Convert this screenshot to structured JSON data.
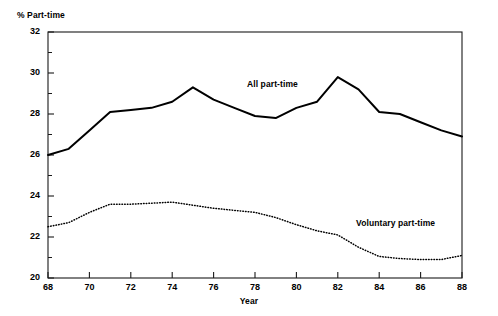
{
  "chart_data": {
    "type": "line",
    "title": "",
    "xlabel": "Year",
    "ylabel": "% Part-time",
    "xlim": [
      68,
      88
    ],
    "ylim": [
      20,
      32
    ],
    "grid": false,
    "legend_position": "inline-annotation",
    "x": [
      68,
      69,
      70,
      71,
      72,
      73,
      74,
      75,
      76,
      77,
      78,
      79,
      80,
      81,
      82,
      83,
      84,
      85,
      86,
      87,
      88
    ],
    "xticks": [
      "68",
      "70",
      "72",
      "74",
      "76",
      "78",
      "80",
      "82",
      "84",
      "86",
      "88"
    ],
    "yticks": [
      "20",
      "22",
      "24",
      "26",
      "28",
      "30",
      "32"
    ],
    "yticks_minor": [
      21,
      23,
      25,
      27,
      29,
      31
    ],
    "series": [
      {
        "name": "All part-time",
        "style": "solid",
        "color": "#000000",
        "values": [
          26.0,
          26.3,
          27.2,
          28.1,
          28.2,
          28.3,
          28.6,
          29.3,
          28.7,
          28.3,
          27.9,
          27.8,
          28.3,
          28.6,
          29.8,
          29.2,
          28.1,
          28.0,
          27.6,
          27.2,
          26.9
        ]
      },
      {
        "name": "Voluntary part-time",
        "style": "dotted",
        "color": "#000000",
        "values": [
          22.5,
          22.7,
          23.2,
          23.6,
          23.6,
          23.65,
          23.7,
          23.55,
          23.4,
          23.3,
          23.2,
          22.95,
          22.6,
          22.3,
          22.1,
          21.5,
          21.05,
          20.95,
          20.9,
          20.9,
          21.1
        ]
      }
    ]
  },
  "axes": {
    "ylabel": "% Part-time",
    "xlabel": "Year"
  },
  "annotations": {
    "all_part_time": "All part-time",
    "voluntary_part_time": "Voluntary part-time"
  }
}
